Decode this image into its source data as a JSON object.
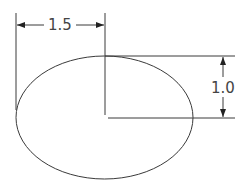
{
  "drawing": {
    "ellipse": {
      "cx": 104.5,
      "cy": 117.5,
      "rx": 88.5,
      "ry": 61.5,
      "stroke": "#3a3a3a"
    },
    "horizontal_dimension": {
      "label": "1.5",
      "y": 25,
      "x1": 16,
      "x2": 105
    },
    "vertical_dimension": {
      "label": "1.0",
      "x": 223,
      "y1": 56,
      "y2": 118
    },
    "line_color": "#3a3a3a",
    "background": "#ffffff"
  }
}
